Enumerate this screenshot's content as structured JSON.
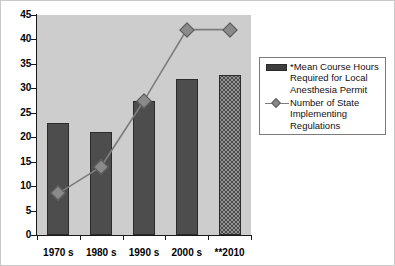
{
  "chart_data": {
    "type": "bar",
    "title": "",
    "subtitle": "",
    "xlabel": "",
    "ylabel": "",
    "ylim": [
      0,
      45
    ],
    "ytick_step": 5,
    "yticks": [
      "0",
      "5",
      "10",
      "15",
      "20",
      "25",
      "30",
      "35",
      "40",
      "45"
    ],
    "grid": false,
    "legend_position": "right",
    "categories": [
      "1970 s",
      "1980 s",
      "1990 s",
      "2000 s",
      "**2010"
    ],
    "series": [
      {
        "name": "*Mean Course Hours Required for Local Anesthesia Permit",
        "type": "bar",
        "values": [
          23,
          21,
          27.5,
          32,
          32.8
        ]
      },
      {
        "name": "Number of State Implementing Regulations",
        "type": "line",
        "values": [
          8.5,
          14,
          27.5,
          42,
          42
        ]
      }
    ]
  },
  "legend": {
    "items": [
      {
        "key": "bar-swatch",
        "lines": [
          "*Mean Course Hours",
          "Required for Local",
          "Anesthesia Permit"
        ]
      },
      {
        "key": "line-marker",
        "lines": [
          "Number of State",
          "Implementing",
          "Regulations"
        ]
      }
    ]
  },
  "colors": {
    "plot_background": "#cdcdcd",
    "bar_fill": "#4d4d4d",
    "bar_fill_2010": "#4a4a4a",
    "line": "#7d7d7d",
    "marker": "#8a8a8a",
    "axis": "#1a1a1a",
    "legend_border": "#7a7a7a",
    "figure_border": "#c9c9c9"
  }
}
